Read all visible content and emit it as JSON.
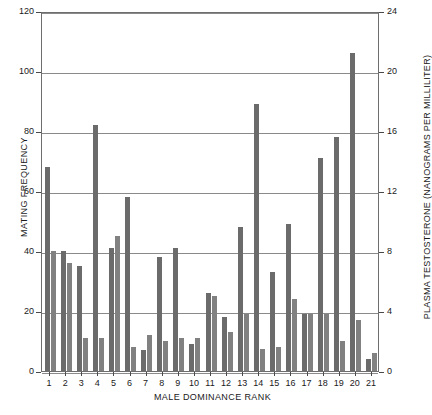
{
  "chart_data": {
    "type": "bar",
    "title": "",
    "subtitle": "",
    "xlabel": "MALE DOMINANCE RANK",
    "ylabel": "MATING FREQUENCY",
    "y2label": "PLASMA TESTOSTERONE (NANOGRAMS PER MILLILITER)",
    "categories": [
      "1",
      "2",
      "3",
      "4",
      "5",
      "6",
      "7",
      "8",
      "9",
      "10",
      "11",
      "12",
      "13",
      "14",
      "15",
      "16",
      "17",
      "18",
      "19",
      "20",
      "21"
    ],
    "ylim": [
      0,
      120
    ],
    "y2lim": [
      0,
      24
    ],
    "yticks": [
      0,
      20,
      40,
      60,
      80,
      100,
      120
    ],
    "y2ticks": [
      0,
      4,
      8,
      12,
      16,
      20,
      24
    ],
    "grid": true,
    "legend": "none",
    "series": [
      {
        "name": "MATING FREQUENCY",
        "axis": "left",
        "color": "#6b6b6b",
        "values": [
          68,
          40,
          35,
          82,
          41,
          58,
          7,
          38,
          41,
          9,
          26,
          18,
          48,
          89,
          33,
          49,
          19,
          71,
          78,
          106,
          4
        ]
      },
      {
        "name": "PLASMA TESTOSTERONE",
        "axis": "right",
        "color": "#818181",
        "values": [
          8,
          7.2,
          2.2,
          2.2,
          9,
          1.6,
          2.4,
          2.0,
          2.2,
          2.2,
          5.0,
          2.6,
          3.8,
          1.5,
          1.6,
          4.8,
          3.8,
          3.8,
          2.0,
          3.4,
          1.2
        ]
      }
    ]
  },
  "axes": {
    "left_tick_labels": [
      "120",
      "100",
      "80",
      "60",
      "40",
      "20",
      "0"
    ],
    "right_tick_labels": [
      "24",
      "20",
      "16",
      "12",
      "8",
      "4",
      "0"
    ]
  }
}
